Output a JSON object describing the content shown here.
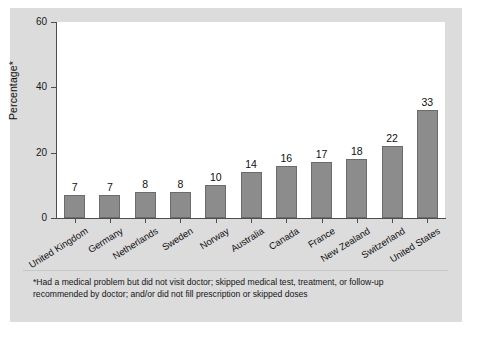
{
  "chart_data": {
    "type": "bar",
    "title": "",
    "subtitle": "",
    "xlabel": "",
    "ylabel": "Percentage*",
    "ylim": [
      0,
      60
    ],
    "yticks": [
      0,
      20,
      40,
      60
    ],
    "grid": false,
    "legend": "none",
    "bar_color": "#8c8c8c",
    "bar_edge_color": "#6b6b6b",
    "panel_color": "#dcdcdc",
    "plot_background": "#ffffff",
    "axis_color": "#4d4d4d",
    "categories": [
      "United Kingdom",
      "Germany",
      "Netherlands",
      "Sweden",
      "Norway",
      "Australia",
      "Canada",
      "France",
      "New Zealand",
      "Switzerland",
      "United States"
    ],
    "values": [
      7,
      7,
      8,
      8,
      10,
      14,
      16,
      17,
      18,
      22,
      33
    ],
    "value_labels": [
      "7",
      "7",
      "8",
      "8",
      "10",
      "14",
      "16",
      "17",
      "18",
      "22",
      "33"
    ]
  },
  "footnote": {
    "text": "*Had a medical problem but did not visit doctor; skipped medical test, treatment, or follow-up recommended by doctor; and/or did not fill prescription or skipped doses"
  },
  "bottom_caption": {
    "text": ""
  }
}
